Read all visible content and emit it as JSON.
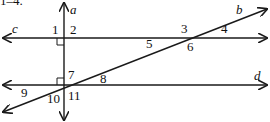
{
  "heading_fragment": "1–4.",
  "lines": {
    "a": {
      "label": "a"
    },
    "b": {
      "label": "b"
    },
    "c": {
      "label": "c"
    },
    "d": {
      "label": "d"
    }
  },
  "angles": [
    "1",
    "2",
    "3",
    "4",
    "5",
    "6",
    "7",
    "8",
    "9",
    "10",
    "11"
  ],
  "colors": {
    "stroke": "#1a1a1a",
    "text": "#111111",
    "background": "#ffffff"
  }
}
